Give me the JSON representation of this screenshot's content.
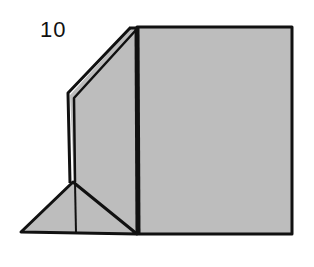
{
  "diagram": {
    "step_number": "10",
    "colors": {
      "fill": "#bdbdbd",
      "stroke": "#111111",
      "background": "#ffffff"
    }
  }
}
